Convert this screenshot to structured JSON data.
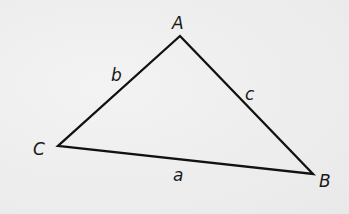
{
  "diagram": {
    "type": "triangle",
    "colors": {
      "background": "#efefef",
      "stroke": "#111111",
      "label": "#1a1a1a"
    },
    "vertices": [
      {
        "id": "A",
        "label": "A",
        "x": 180,
        "y": 36,
        "label_x": 172,
        "label_y": 29
      },
      {
        "id": "B",
        "label": "B",
        "x": 313,
        "y": 174,
        "label_x": 319,
        "label_y": 187
      },
      {
        "id": "C",
        "label": "C",
        "x": 58,
        "y": 146,
        "label_x": 33,
        "label_y": 155
      }
    ],
    "sides": [
      {
        "id": "a",
        "label": "a",
        "from": "C",
        "to": "B",
        "label_x": 173,
        "label_y": 181
      },
      {
        "id": "b",
        "label": "b",
        "from": "A",
        "to": "C",
        "label_x": 111,
        "label_y": 81
      },
      {
        "id": "c",
        "label": "c",
        "from": "A",
        "to": "B",
        "label_x": 245,
        "label_y": 100
      }
    ]
  }
}
